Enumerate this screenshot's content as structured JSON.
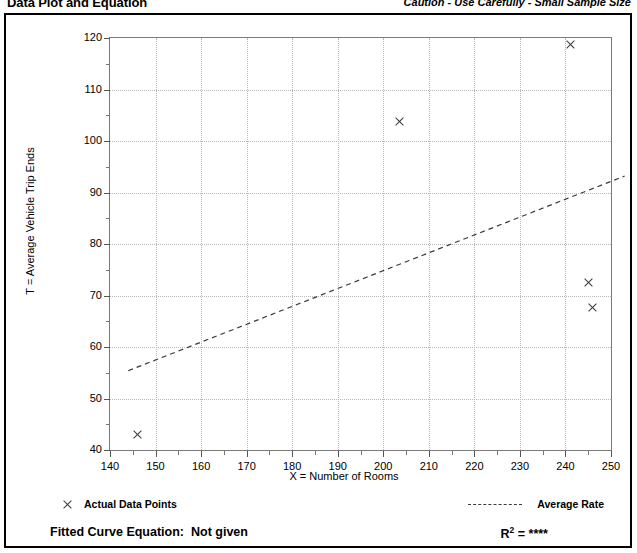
{
  "header": {
    "title": "Data Plot and Equation",
    "caution": "Caution - Use Carefully - Small Sample Size"
  },
  "legend": {
    "data_points_label": "Actual Data Points",
    "average_rate_label": "Average Rate",
    "marker_icon": "x-marker-icon",
    "line_icon": "dashed-line-icon"
  },
  "equation": {
    "fitted_label": "Fitted Curve Equation:  Not given",
    "r_squared_prefix": "R",
    "r_squared_exponent": "2",
    "r_squared_value": " = ****"
  },
  "chart_data": {
    "type": "scatter",
    "title": "Data Plot and Equation",
    "xlabel": "X = Number of Rooms",
    "ylabel": "T = Average Vehicle Trip Ends",
    "xlim": [
      140,
      250
    ],
    "ylim": [
      40,
      120
    ],
    "x_ticks": [
      140,
      150,
      160,
      170,
      180,
      190,
      200,
      210,
      220,
      230,
      240,
      250
    ],
    "y_ticks": [
      40,
      50,
      60,
      70,
      80,
      90,
      100,
      110,
      120
    ],
    "x_minor_step": 5,
    "y_minor_step": 5,
    "grid": true,
    "legend_position": "below-plot",
    "points": [
      {
        "x": 146,
        "y": 43
      },
      {
        "x": 203.5,
        "y": 103.7
      },
      {
        "x": 241,
        "y": 118.8
      },
      {
        "x": 245,
        "y": 72.5
      },
      {
        "x": 246,
        "y": 67.7
      }
    ],
    "series": [
      {
        "name": "Average Rate",
        "type": "line",
        "style": "dashed",
        "x": [
          144,
          253
        ],
        "values": [
          55.4,
          93.2
        ]
      }
    ],
    "annotations": {
      "r_squared": "****",
      "fitted_curve_equation": "Not given",
      "caution": "Caution - Use Carefully - Small Sample Size"
    }
  }
}
